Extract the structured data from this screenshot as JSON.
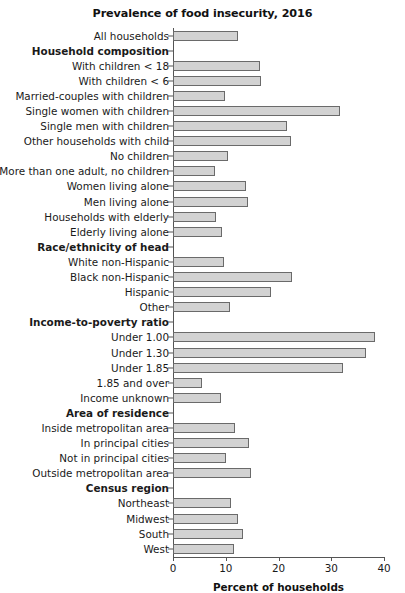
{
  "chart_data": {
    "type": "bar",
    "orientation": "horizontal",
    "title": "Prevalence of food insecurity, 2016",
    "xlabel": "Percent of households",
    "ylabel": "",
    "xlim": [
      0,
      40
    ],
    "xticks": [
      0,
      10,
      20,
      30,
      40
    ],
    "xtick_labels": [
      "0",
      "10",
      "20",
      "30",
      "40"
    ],
    "grid": false,
    "legend": null,
    "bar_color": "#d2d2d2",
    "bar_edge_color": "#6a6a6a",
    "axis_color": "#555555",
    "categories": [
      "All households",
      "Household composition",
      "With children < 18",
      "With children < 6",
      "Married-couples with children",
      "Single women with children",
      "Single men with children",
      "Other households with child",
      "No children",
      "More than one adult, no children",
      "Women living alone",
      "Men living alone",
      "Households with elderly",
      "Elderly living alone",
      "Race/ethnicity of head",
      "White non-Hispanic",
      "Black non-Hispanic",
      "Hispanic",
      "Other",
      "Income-to-poverty ratio",
      "Under 1.00",
      "Under 1.30",
      "Under 1.85",
      "1.85 and over",
      "Income unknown",
      "Area of residence",
      "Inside metropolitan area",
      "In principal cities",
      "Not in principal cities",
      "Outside metropolitan area",
      "Census region",
      "Northeast",
      "Midwest",
      "South",
      "West"
    ],
    "values": [
      12.3,
      null,
      16.5,
      16.6,
      9.8,
      31.6,
      21.7,
      22.4,
      10.5,
      8.0,
      13.8,
      14.3,
      8.2,
      9.2,
      null,
      9.7,
      22.5,
      18.5,
      10.9,
      null,
      38.3,
      36.6,
      32.2,
      5.5,
      9.1,
      null,
      11.7,
      14.4,
      10.0,
      14.7,
      null,
      11.0,
      12.4,
      13.3,
      11.6
    ],
    "group_headers": [
      "Household composition",
      "Race/ethnicity of head",
      "Income-to-poverty ratio",
      "Area of residence",
      "Census region"
    ]
  }
}
